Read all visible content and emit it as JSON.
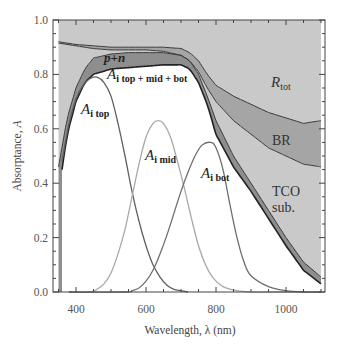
{
  "chart_data": {
    "type": "area",
    "title": "",
    "xlabel": "Wavelength, λ (nm)",
    "ylabel": "Absorptance, A",
    "xlim": [
      350,
      1100
    ],
    "ylim": [
      0.0,
      1.0
    ],
    "x_ticks": [
      400,
      600,
      800,
      1000
    ],
    "x_tick_labels": [
      "400",
      "600",
      "800",
      "1000"
    ],
    "y_ticks": [
      0.0,
      0.2,
      0.4,
      0.6,
      0.8,
      1.0
    ],
    "y_tick_labels": [
      "0.0",
      "0.2",
      "0.4",
      "0.6",
      "0.8",
      "1.0"
    ],
    "grid": false,
    "legend": "none (inline labels)",
    "regions": [
      {
        "name": "R_tot",
        "label": "R",
        "sub": "tot",
        "fill": "#c8c8c8",
        "description": "Total reflectance (between 1 and 1-R curve)"
      },
      {
        "name": "BR",
        "label": "BR",
        "fill": "#a6a6a6",
        "description": "Back reflector parasitic absorption"
      },
      {
        "name": "TCO sub.",
        "label_lines": [
          "TCO",
          "sub."
        ],
        "fill": "#c8c8c8",
        "description": "TCO/substrate parasitic absorption"
      },
      {
        "name": "p+n",
        "label": "p+n",
        "fill": "#8c8c8c",
        "description": "Doped layer parasitic absorption"
      }
    ],
    "boundaries": [
      {
        "name": "1 - R_tot",
        "x": [
          350,
          400,
          450,
          500,
          550,
          600,
          650,
          700,
          725,
          750,
          775,
          800,
          850,
          900,
          950,
          1000,
          1050,
          1100
        ],
        "y": [
          0.92,
          0.91,
          0.905,
          0.9,
          0.9,
          0.9,
          0.9,
          0.895,
          0.88,
          0.85,
          0.8,
          0.76,
          0.72,
          0.69,
          0.66,
          0.64,
          0.62,
          0.63
        ]
      },
      {
        "name": "BR top",
        "x": [
          350,
          400,
          450,
          500,
          550,
          600,
          650,
          700,
          725,
          750,
          775,
          800,
          850,
          900,
          950,
          1000,
          1050,
          1100
        ],
        "y": [
          0.915,
          0.905,
          0.895,
          0.89,
          0.89,
          0.89,
          0.885,
          0.87,
          0.85,
          0.81,
          0.75,
          0.7,
          0.63,
          0.58,
          0.53,
          0.5,
          0.47,
          0.46
        ]
      },
      {
        "name": "TCO/BR boundary (A_i + p+n + TCO)",
        "x": [
          350,
          375,
          400,
          425,
          450,
          500,
          550,
          600,
          650,
          700,
          725,
          750,
          775,
          800,
          850,
          900,
          950,
          1000,
          1050,
          1100
        ],
        "y": [
          0.46,
          0.64,
          0.75,
          0.82,
          0.86,
          0.875,
          0.88,
          0.88,
          0.88,
          0.87,
          0.85,
          0.8,
          0.72,
          0.63,
          0.5,
          0.4,
          0.3,
          0.2,
          0.11,
          0.055
        ]
      },
      {
        "name": "A_i top + mid + bot",
        "x": [
          360,
          375,
          400,
          425,
          450,
          475,
          500,
          550,
          600,
          650,
          700,
          725,
          750,
          775,
          800,
          850,
          900,
          950,
          1000,
          1050,
          1100
        ],
        "y": [
          0.45,
          0.58,
          0.7,
          0.77,
          0.8,
          0.81,
          0.82,
          0.825,
          0.83,
          0.835,
          0.835,
          0.82,
          0.77,
          0.69,
          0.58,
          0.46,
          0.37,
          0.27,
          0.17,
          0.08,
          0.03
        ]
      }
    ],
    "series": [
      {
        "name": "A_i top",
        "label": "A",
        "sub": "i top",
        "color": "#606060",
        "x": [
          360,
          380,
          400,
          420,
          440,
          460,
          480,
          500,
          520,
          540,
          560,
          580,
          600,
          620,
          640,
          660,
          680,
          700,
          720
        ],
        "y": [
          0.48,
          0.62,
          0.71,
          0.76,
          0.785,
          0.79,
          0.77,
          0.72,
          0.62,
          0.5,
          0.37,
          0.26,
          0.17,
          0.1,
          0.055,
          0.025,
          0.01,
          0.005,
          0.0
        ]
      },
      {
        "name": "A_i mid",
        "label": "A",
        "sub": "i mid",
        "color": "#a8a8a8",
        "x": [
          440,
          460,
          480,
          500,
          520,
          540,
          560,
          580,
          600,
          620,
          635,
          650,
          670,
          690,
          710,
          730,
          750,
          770,
          790,
          820,
          860,
          900,
          950
        ],
        "y": [
          0.0,
          0.01,
          0.03,
          0.07,
          0.14,
          0.23,
          0.35,
          0.47,
          0.57,
          0.62,
          0.63,
          0.62,
          0.57,
          0.48,
          0.38,
          0.27,
          0.17,
          0.1,
          0.055,
          0.02,
          0.005,
          0.0,
          0.0
        ]
      },
      {
        "name": "A_i bot",
        "label": "A",
        "sub": "i bot",
        "color": "#6e6e6e",
        "x": [
          540,
          560,
          580,
          600,
          620,
          640,
          660,
          680,
          700,
          720,
          740,
          760,
          785,
          800,
          820,
          840,
          860,
          880,
          900,
          950,
          1000,
          1050,
          1100
        ],
        "y": [
          0.0,
          0.005,
          0.015,
          0.04,
          0.08,
          0.14,
          0.21,
          0.29,
          0.37,
          0.44,
          0.5,
          0.54,
          0.55,
          0.53,
          0.45,
          0.32,
          0.2,
          0.11,
          0.06,
          0.02,
          0.005,
          0.0,
          0.0
        ]
      }
    ],
    "annotations": [
      {
        "text": "p+n",
        "x": 470,
        "y": 0.865
      },
      {
        "text": "A i top + mid + bot",
        "x": 480,
        "y": 0.8
      },
      {
        "text": "A i top",
        "x": 395,
        "y": 0.68
      },
      {
        "text": "A i mid",
        "x": 600,
        "y": 0.49
      },
      {
        "text": "A i bot",
        "x": 755,
        "y": 0.43
      },
      {
        "text": "R tot",
        "x": 980,
        "y": 0.81
      },
      {
        "text": "BR",
        "x": 990,
        "y": 0.57
      },
      {
        "text": "TCO sub.",
        "x": 990,
        "y": 0.4
      }
    ]
  },
  "labels": {
    "xlabel": "Wavelength, λ (nm)",
    "ylabel": "Absorptance, A",
    "ylabel_main": "Absorptance, ",
    "ylabel_var": "A",
    "pn": "p+n",
    "A": "A",
    "top_mid_bot_sub": "i top + mid + bot",
    "top_sub": "i top",
    "mid_sub": "i mid",
    "bot_sub": "i bot",
    "R": "R",
    "tot_sub": "tot",
    "BR": "BR",
    "TCO": "TCO",
    "sub": "sub."
  }
}
